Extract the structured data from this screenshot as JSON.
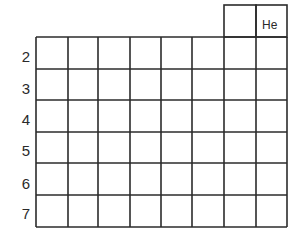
{
  "diagram": {
    "title": "",
    "top_cells": [
      {
        "label": ""
      },
      {
        "label": "He"
      }
    ],
    "period_labels": [
      "2",
      "3",
      "4",
      "5",
      "6",
      "7"
    ],
    "columns": 8,
    "rows": 6,
    "line_color": "#2b2b2b"
  }
}
